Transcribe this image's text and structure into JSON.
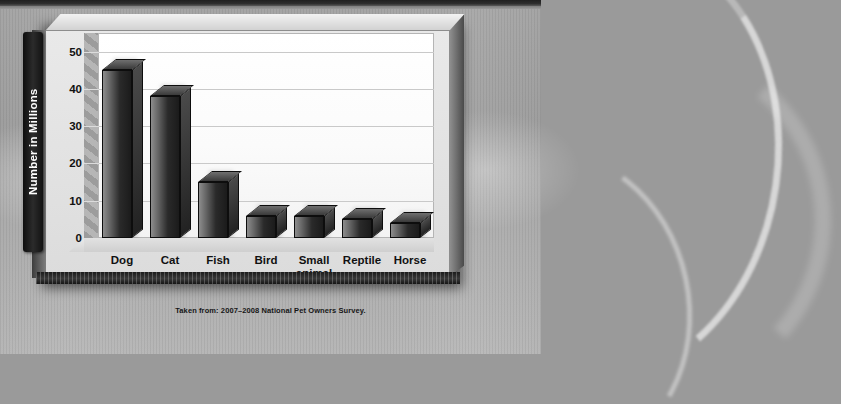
{
  "chart_data": {
    "type": "bar",
    "title": "",
    "subtitle": "",
    "xlabel": "",
    "ylabel": "Number in Millions",
    "ylim": [
      0,
      55
    ],
    "yticks": [
      0,
      10,
      20,
      30,
      40,
      50
    ],
    "grid": true,
    "legend": null,
    "style": "3d-grayscale-bar",
    "categories": [
      "Dog",
      "Cat",
      "Fish",
      "Bird",
      "Small animal",
      "Reptile",
      "Horse"
    ],
    "values": [
      45,
      38,
      15,
      6,
      6,
      5,
      4
    ],
    "units": "millions",
    "source_note": "Taken from: 2007–2008 National Pet Owners Survey."
  },
  "chart": {
    "axis_title": "Number in Millions",
    "y_ticks": [
      {
        "label": "50",
        "value": 50
      },
      {
        "label": "40",
        "value": 40
      },
      {
        "label": "30",
        "value": 30
      },
      {
        "label": "20",
        "value": 20
      },
      {
        "label": "10",
        "value": 10
      },
      {
        "label": "0",
        "value": 0
      }
    ],
    "bars": [
      {
        "label": "Dog",
        "value": 45
      },
      {
        "label": "Cat",
        "value": 38
      },
      {
        "label": "Fish",
        "value": 15
      },
      {
        "label": "Bird",
        "value": 6
      },
      {
        "label": "Small animal",
        "value": 6
      },
      {
        "label": "Reptile",
        "value": 5
      },
      {
        "label": "Horse",
        "value": 4
      }
    ]
  },
  "caption": {
    "text": "Taken from: 2007–2008 National Pet Owners Survey."
  },
  "colors": {
    "bar_front_light": "#8d8d8d",
    "bar_front_dark": "#1b1b1b",
    "plot_background": "#ffffff",
    "slab_face": "#e4e4e4",
    "page_background": "#9c9c9c",
    "axis_title_bar": "#141414",
    "gridline": "#c9c9c9"
  }
}
